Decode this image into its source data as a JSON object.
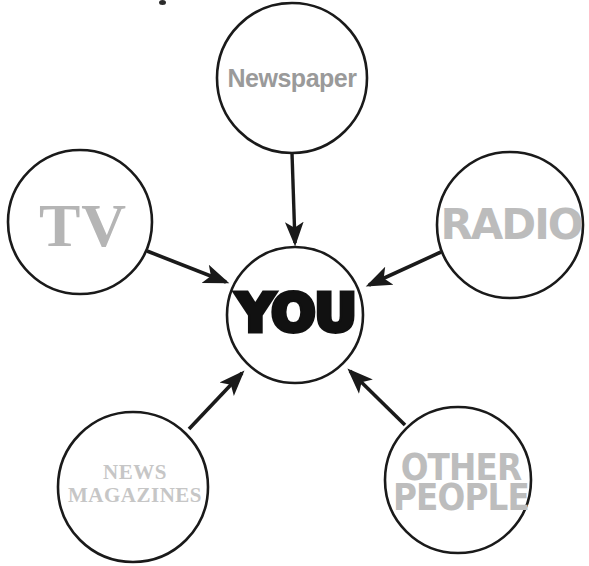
{
  "diagram": {
    "type": "hub-and-spoke",
    "background_color": "#ffffff",
    "outline_color": "#1a1a1a",
    "arrow_color": "#1a1a1a",
    "center": {
      "id": "you",
      "label": "YOU",
      "cx": 295,
      "cy": 315,
      "r": 68,
      "text_color": "#111111"
    },
    "spokes": [
      {
        "id": "newspaper",
        "label": "Newspaper",
        "cx": 292,
        "cy": 78,
        "r": 75,
        "text_color": "#9a9a9a",
        "arrow": {
          "x1": 292,
          "y1": 153,
          "x2": 295,
          "y2": 245,
          "direction": "down"
        }
      },
      {
        "id": "tv",
        "label": "TV",
        "cx": 80,
        "cy": 222,
        "r": 72,
        "text_color": "#b5b5b5",
        "arrow": {
          "x1": 148,
          "y1": 252,
          "x2": 228,
          "y2": 283,
          "direction": "down-right"
        }
      },
      {
        "id": "radio",
        "label": "RADIO",
        "cx": 510,
        "cy": 225,
        "r": 73,
        "text_color": "#bcbcbc",
        "arrow": {
          "x1": 440,
          "y1": 252,
          "x2": 368,
          "y2": 285,
          "direction": "down-left"
        }
      },
      {
        "id": "news-magazines",
        "label": "NEWS\nMAGAZINES",
        "cx": 133,
        "cy": 487,
        "r": 75,
        "text_color": "#c6c6c6",
        "arrow": {
          "x1": 190,
          "y1": 428,
          "x2": 243,
          "y2": 372,
          "direction": "up-right"
        }
      },
      {
        "id": "other-people",
        "label": "OTHER\nPEOPLE",
        "cx": 458,
        "cy": 480,
        "r": 73,
        "text_color": "#bdbdbd",
        "arrow": {
          "x1": 404,
          "y1": 424,
          "x2": 349,
          "y2": 370,
          "direction": "up-left"
        }
      }
    ]
  }
}
